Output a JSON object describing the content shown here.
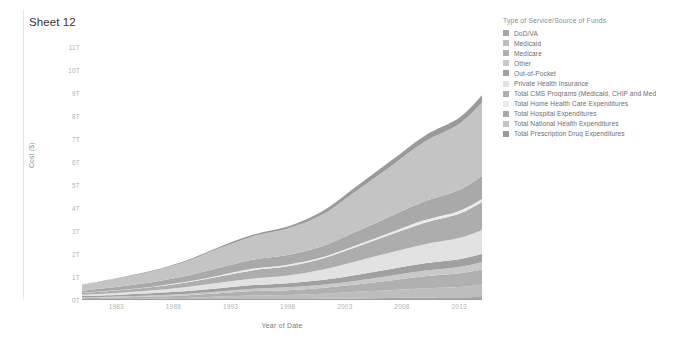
{
  "worksheet": {
    "title": "Sheet 12"
  },
  "legend": {
    "title": "Type of Service/Source of Funds",
    "items": [
      {
        "label": "DoD/VA",
        "color": "#a6a6a6"
      },
      {
        "label": "Medicaid",
        "color": "#bdbdbd"
      },
      {
        "label": "Medicare",
        "color": "#b0b0b0"
      },
      {
        "label": "Other",
        "color": "#c9c9c9"
      },
      {
        "label": "Out-of-Pocket",
        "color": "#a0a0a0"
      },
      {
        "label": "Private Health Insurance",
        "color": "#e2e2e2"
      },
      {
        "label": "Total CMS Programs (Medicaid, CHIP and Med",
        "color": "#adadad"
      },
      {
        "label": "Total Home Health Care Expenditures",
        "color": "#ececec"
      },
      {
        "label": "Total Hospital Expenditures",
        "color": "#a9a9a9"
      },
      {
        "label": "Total National Health Expenditures",
        "color": "#c4c4c4"
      },
      {
        "label": "Total Prescription Drug Expenditures",
        "color": "#9a9a9a"
      }
    ]
  },
  "chart_data": {
    "type": "area",
    "title": "Sheet 12",
    "xlabel": "Year of Date",
    "ylabel": "Cost ($)",
    "xlim": [
      1980,
      2015
    ],
    "ylim": [
      0,
      11500000000000
    ],
    "y_tick_labels": [
      "0T",
      "1T",
      "2T",
      "3T",
      "4T",
      "5T",
      "6T",
      "7T",
      "8T",
      "9T",
      "10T",
      "11T"
    ],
    "y_tick_values": [
      0,
      1,
      2,
      3,
      4,
      5,
      6,
      7,
      8,
      9,
      10,
      11
    ],
    "x_tick_labels": [
      "1983",
      "1988",
      "1993",
      "1998",
      "2003",
      "2008",
      "2013"
    ],
    "x_tick_values": [
      1983,
      1988,
      1993,
      1998,
      2003,
      2008,
      2013
    ],
    "grid": false,
    "legend_position": "right",
    "stacked": true,
    "units": "trillions of dollars",
    "x": [
      1980,
      1983,
      1986,
      1989,
      1992,
      1995,
      1998,
      2001,
      2004,
      2007,
      2010,
      2013,
      2015
    ],
    "series": [
      {
        "name": "DoD/VA",
        "color": "#a6a6a6",
        "values": [
          0.01,
          0.01,
          0.02,
          0.02,
          0.03,
          0.04,
          0.04,
          0.05,
          0.07,
          0.09,
          0.11,
          0.12,
          0.13
        ]
      },
      {
        "name": "Medicaid",
        "color": "#bdbdbd",
        "values": [
          0.03,
          0.04,
          0.05,
          0.07,
          0.12,
          0.16,
          0.18,
          0.22,
          0.29,
          0.33,
          0.4,
          0.45,
          0.55
        ]
      },
      {
        "name": "Medicare",
        "color": "#b0b0b0",
        "values": [
          0.04,
          0.06,
          0.08,
          0.11,
          0.14,
          0.19,
          0.21,
          0.25,
          0.31,
          0.43,
          0.52,
          0.59,
          0.65
        ]
      },
      {
        "name": "Other",
        "color": "#c9c9c9",
        "values": [
          0.03,
          0.04,
          0.05,
          0.06,
          0.08,
          0.1,
          0.12,
          0.14,
          0.17,
          0.21,
          0.25,
          0.28,
          0.31
        ]
      },
      {
        "name": "Out-of-Pocket",
        "color": "#a0a0a0",
        "values": [
          0.06,
          0.07,
          0.09,
          0.12,
          0.14,
          0.16,
          0.18,
          0.21,
          0.25,
          0.29,
          0.32,
          0.34,
          0.36
        ]
      },
      {
        "name": "Private Health Insurance",
        "color": "#e2e2e2",
        "values": [
          0.06,
          0.09,
          0.12,
          0.18,
          0.24,
          0.29,
          0.34,
          0.45,
          0.6,
          0.72,
          0.83,
          0.92,
          1.05
        ]
      },
      {
        "name": "Total CMS Programs (Medicaid, CHIP and Med",
        "color": "#adadad",
        "values": [
          0.07,
          0.1,
          0.14,
          0.19,
          0.27,
          0.36,
          0.4,
          0.48,
          0.62,
          0.78,
          0.94,
          1.06,
          1.22
        ]
      },
      {
        "name": "Total Home Health Care Expenditures",
        "color": "#ececec",
        "values": [
          0.01,
          0.01,
          0.02,
          0.03,
          0.05,
          0.07,
          0.07,
          0.06,
          0.07,
          0.09,
          0.11,
          0.12,
          0.13
        ]
      },
      {
        "name": "Total Hospital Expenditures",
        "color": "#a9a9a9",
        "values": [
          0.1,
          0.15,
          0.19,
          0.25,
          0.33,
          0.39,
          0.42,
          0.48,
          0.6,
          0.71,
          0.82,
          0.91,
          1.0
        ]
      },
      {
        "name": "Total National Health Expenditures",
        "color": "#c4c4c4",
        "values": [
          0.25,
          0.36,
          0.47,
          0.63,
          0.85,
          1.02,
          1.15,
          1.37,
          1.77,
          2.17,
          2.6,
          2.88,
          3.2
        ]
      },
      {
        "name": "Total Prescription Drug Expenditures",
        "color": "#9a9a9a",
        "values": [
          0.01,
          0.02,
          0.03,
          0.04,
          0.06,
          0.07,
          0.09,
          0.14,
          0.19,
          0.23,
          0.26,
          0.27,
          0.32
        ]
      }
    ]
  }
}
